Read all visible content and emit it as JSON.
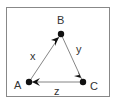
{
  "diagram": {
    "colors": {
      "frame": "#888888",
      "edge": "#666666",
      "node": "#111111",
      "text": "#333333"
    },
    "nodes": [
      {
        "id": "A",
        "label": "A"
      },
      {
        "id": "B",
        "label": "B"
      },
      {
        "id": "C",
        "label": "C"
      }
    ],
    "edges": [
      {
        "from": "A",
        "to": "B",
        "label": "x"
      },
      {
        "from": "B",
        "to": "C",
        "label": "y"
      },
      {
        "from": "C",
        "to": "A",
        "label": "z"
      }
    ]
  }
}
